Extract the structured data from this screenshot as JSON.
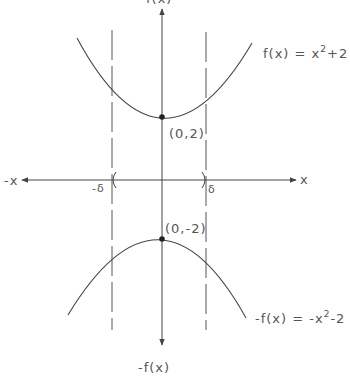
{
  "figure": {
    "colors": {
      "stroke": "#444444",
      "text": "#555555",
      "background": "#ffffff"
    },
    "axes": {
      "x_positive_label": "x",
      "x_negative_label": "-x",
      "y_positive_label": "f(x)",
      "y_negative_label": "-f(x)"
    },
    "delta_marks": {
      "negative_label": "-δ",
      "positive_label": "δ"
    },
    "curves": {
      "upper": {
        "label_prefix": "f(x) = x",
        "label_exponent": "2",
        "label_suffix": "+2",
        "vertex_label": "(0,2)"
      },
      "lower": {
        "label_prefix": "-f(x) = -x",
        "label_exponent": "2",
        "label_suffix": "-2",
        "vertex_label": "(0,-2)"
      }
    }
  }
}
